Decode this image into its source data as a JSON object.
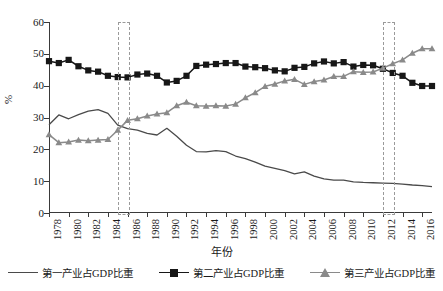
{
  "axes": {
    "ylabel": "%",
    "xlabel": "年份",
    "yticks": [
      "0",
      "10",
      "20",
      "30",
      "40",
      "50",
      "60"
    ],
    "xticks": [
      "1978",
      "1980",
      "1982",
      "1984",
      "1986",
      "1988",
      "1990",
      "1992",
      "1994",
      "1996",
      "1998",
      "2000",
      "2002",
      "2004",
      "2006",
      "2008",
      "2010",
      "2012",
      "2014",
      "2016"
    ]
  },
  "legend": {
    "items": [
      {
        "label": "第一产业占GDP比重",
        "marker": "line",
        "color": "#4a4a4a"
      },
      {
        "label": "第二产业占GDP比重",
        "marker": "square",
        "color": "#171717"
      },
      {
        "label": "第三产业占GDP比重",
        "marker": "triangle",
        "color": "#8a8a8a"
      }
    ]
  },
  "highlights": [
    {
      "name": "crossover-1985",
      "start_year": 1985,
      "end_year": 1986
    },
    {
      "name": "crossover-2012",
      "start_year": 2012,
      "end_year": 2013
    }
  ],
  "chart_data": {
    "type": "line",
    "title": "",
    "xlabel": "年份",
    "ylabel": "%",
    "xlim": [
      1978,
      2017
    ],
    "ylim": [
      0,
      60
    ],
    "grid": false,
    "legend_position": "bottom",
    "x": [
      1978,
      1979,
      1980,
      1981,
      1982,
      1983,
      1984,
      1985,
      1986,
      1987,
      1988,
      1989,
      1990,
      1991,
      1992,
      1993,
      1994,
      1995,
      1996,
      1997,
      1998,
      1999,
      2000,
      2001,
      2002,
      2003,
      2004,
      2005,
      2006,
      2007,
      2008,
      2009,
      2010,
      2011,
      2012,
      2013,
      2014,
      2015,
      2016,
      2017
    ],
    "series": [
      {
        "name": "第一产业占GDP比重",
        "color": "#4a4a4a",
        "marker": "none",
        "values": [
          27.7,
          30.8,
          29.6,
          30.9,
          32.0,
          32.5,
          31.3,
          27.6,
          26.5,
          26.0,
          25.0,
          24.5,
          26.6,
          24.1,
          21.3,
          19.3,
          19.2,
          19.6,
          19.3,
          17.9,
          17.1,
          16.0,
          14.7,
          14.0,
          13.3,
          12.3,
          12.9,
          11.6,
          10.7,
          10.3,
          10.3,
          9.8,
          9.6,
          9.5,
          9.4,
          9.3,
          9.1,
          8.8,
          8.6,
          8.3
        ]
      },
      {
        "name": "第二产业占GDP比重",
        "color": "#171717",
        "marker": "square",
        "values": [
          47.7,
          47.1,
          48.1,
          46.1,
          44.8,
          44.4,
          43.1,
          42.7,
          42.6,
          43.5,
          43.8,
          43.1,
          41.0,
          41.5,
          43.1,
          46.2,
          46.6,
          46.8,
          47.1,
          47.1,
          46.0,
          45.8,
          45.5,
          44.8,
          44.5,
          45.6,
          45.9,
          47.0,
          47.6,
          47.0,
          47.4,
          46.0,
          46.5,
          46.4,
          45.3,
          44.0,
          43.1,
          40.9,
          39.9,
          39.9
        ]
      },
      {
        "name": "第三产业占GDP比重",
        "color": "#8a8a8a",
        "marker": "triangle",
        "values": [
          24.6,
          22.1,
          22.3,
          22.9,
          22.7,
          22.9,
          23.1,
          26.0,
          29.1,
          29.6,
          30.5,
          31.1,
          31.5,
          33.7,
          34.8,
          33.7,
          33.6,
          33.7,
          33.6,
          34.2,
          36.2,
          37.8,
          39.8,
          40.5,
          41.5,
          42.0,
          40.4,
          41.3,
          41.8,
          42.9,
          42.9,
          44.4,
          44.2,
          44.3,
          45.5,
          46.9,
          48.1,
          50.2,
          51.6,
          51.6
        ]
      }
    ]
  }
}
